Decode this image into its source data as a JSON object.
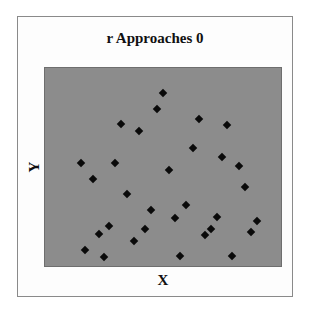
{
  "chart_data": {
    "type": "scatter",
    "title": "r Approaches 0",
    "xlabel": "X",
    "ylabel": "Y",
    "xlim": [
      0,
      100
    ],
    "ylim": [
      0,
      100
    ],
    "grid": false,
    "legend": null,
    "axis_ticks": "none",
    "colors": {
      "plot_background": "#8c8c8c",
      "marker": "#0a0a0a",
      "page_background": "#ffffff"
    },
    "marker": "diamond",
    "points": [
      {
        "x": 50,
        "y": 87.5
      },
      {
        "x": 47.5,
        "y": 79.5
      },
      {
        "x": 32.4,
        "y": 71.5
      },
      {
        "x": 39.9,
        "y": 68
      },
      {
        "x": 65.1,
        "y": 74
      },
      {
        "x": 77.3,
        "y": 71
      },
      {
        "x": 62.6,
        "y": 59.5
      },
      {
        "x": 15.1,
        "y": 52
      },
      {
        "x": 29.8,
        "y": 52
      },
      {
        "x": 74.8,
        "y": 55
      },
      {
        "x": 82.4,
        "y": 50.5
      },
      {
        "x": 20.2,
        "y": 44
      },
      {
        "x": 52.5,
        "y": 48.5
      },
      {
        "x": 84.9,
        "y": 40
      },
      {
        "x": 34.9,
        "y": 36.5
      },
      {
        "x": 59.7,
        "y": 31
      },
      {
        "x": 45,
        "y": 28.5
      },
      {
        "x": 55,
        "y": 24
      },
      {
        "x": 42.4,
        "y": 18.5
      },
      {
        "x": 27.3,
        "y": 20
      },
      {
        "x": 22.7,
        "y": 16
      },
      {
        "x": 16.8,
        "y": 8
      },
      {
        "x": 25.2,
        "y": 4.5
      },
      {
        "x": 37.8,
        "y": 12.5
      },
      {
        "x": 57.1,
        "y": 5
      },
      {
        "x": 72.7,
        "y": 25
      },
      {
        "x": 89.9,
        "y": 22.5
      },
      {
        "x": 70.2,
        "y": 18.5
      },
      {
        "x": 87.4,
        "y": 17
      },
      {
        "x": 67.6,
        "y": 15.5
      },
      {
        "x": 79.4,
        "y": 5
      }
    ]
  }
}
